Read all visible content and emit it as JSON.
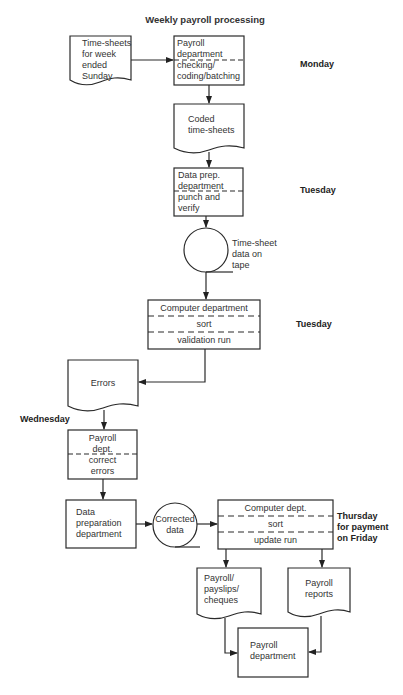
{
  "title": "Weekly payroll processing",
  "nodes": {
    "timesheets": {
      "shape": "document",
      "lines": [
        "Time-sheets",
        "for week",
        "ended",
        "Sunday"
      ]
    },
    "payroll_dept_check": {
      "shape": "process",
      "top": [
        "Payroll",
        "department"
      ],
      "bottom": [
        "checking/",
        "coding/batching"
      ]
    },
    "coded_timesheets": {
      "shape": "document",
      "lines": [
        "Coded",
        "time-sheets"
      ]
    },
    "data_prep_punch": {
      "shape": "process",
      "top": [
        "Data prep.",
        "department"
      ],
      "bottom": [
        "punch and",
        "verify"
      ]
    },
    "tape": {
      "shape": "magnetic-tape",
      "lines": [
        "Time-sheet",
        "data on",
        "tape"
      ]
    },
    "computer_validation": {
      "shape": "process",
      "sections": [
        "Computer department",
        "sort",
        "validation run"
      ]
    },
    "errors": {
      "shape": "document",
      "lines": [
        "Errors"
      ]
    },
    "payroll_correct": {
      "shape": "process",
      "top": [
        "Payroll",
        "dept."
      ],
      "bottom": [
        "correct",
        "errors"
      ]
    },
    "data_prep_dept": {
      "shape": "process",
      "lines": [
        "Data",
        "preparation",
        "department"
      ]
    },
    "corrected_data": {
      "shape": "magnetic-tape",
      "lines": [
        "Corrected",
        "data"
      ]
    },
    "computer_update": {
      "shape": "process",
      "sections": [
        "Computer dept.",
        "sort",
        "update run"
      ]
    },
    "payslips": {
      "shape": "document",
      "lines": [
        "Payroll/",
        "payslips/",
        "cheques"
      ]
    },
    "reports": {
      "shape": "document",
      "lines": [
        "Payroll",
        "reports"
      ]
    },
    "payroll_final": {
      "shape": "process",
      "lines": [
        "Payroll",
        "department"
      ]
    }
  },
  "day_labels": {
    "monday": "Monday",
    "tuesday_1": "Tuesday",
    "tuesday_2": "Tuesday",
    "wednesday": "Wednesday",
    "thursday": [
      "Thursday",
      "for payment",
      "on Friday"
    ]
  },
  "edges": [
    [
      "timesheets",
      "payroll_dept_check"
    ],
    [
      "payroll_dept_check",
      "coded_timesheets"
    ],
    [
      "coded_timesheets",
      "data_prep_punch"
    ],
    [
      "data_prep_punch",
      "tape"
    ],
    [
      "tape",
      "computer_validation"
    ],
    [
      "computer_validation",
      "errors"
    ],
    [
      "errors",
      "payroll_correct"
    ],
    [
      "payroll_correct",
      "data_prep_dept"
    ],
    [
      "data_prep_dept",
      "corrected_data"
    ],
    [
      "corrected_data",
      "computer_update"
    ],
    [
      "computer_update",
      "payslips"
    ],
    [
      "computer_update",
      "reports"
    ],
    [
      "payslips",
      "payroll_final"
    ],
    [
      "reports",
      "payroll_final"
    ]
  ]
}
